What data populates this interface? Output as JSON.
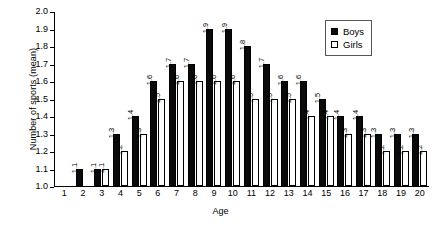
{
  "chart_data": {
    "type": "bar",
    "title": "",
    "xlabel": "Age",
    "ylabel": "Number of sports (mean)",
    "ylim": [
      1.0,
      2.0
    ],
    "yticks": [
      "1.0",
      "1.1",
      "1.2",
      "1.3",
      "1.4",
      "1.5",
      "1.6",
      "1.7",
      "1.8",
      "1.9",
      "2.0"
    ],
    "grid": false,
    "legend_position": "top-right",
    "categories": [
      "1",
      "2",
      "3",
      "4",
      "5",
      "6",
      "7",
      "8",
      "9",
      "10",
      "11",
      "12",
      "13",
      "14",
      "15",
      "16",
      "17",
      "18",
      "19",
      "20"
    ],
    "series": [
      {
        "name": "Boys",
        "color": "#0a0a0a",
        "values": [
          null,
          1.1,
          1.1,
          1.3,
          1.4,
          1.6,
          1.7,
          1.7,
          1.9,
          1.9,
          1.8,
          1.7,
          1.6,
          1.6,
          1.5,
          1.4,
          1.4,
          1.3,
          1.3,
          1.3
        ],
        "labels": [
          "",
          "1.1",
          "1.1",
          "1.3",
          "1.4",
          "1.6",
          "1.7",
          "1.7",
          "1.9",
          "1.9",
          "1.8",
          "1.7",
          "1.6",
          "1.6",
          "1.5",
          "1.4",
          "1.4",
          "1.3",
          "1.3",
          "1.3"
        ]
      },
      {
        "name": "Girls",
        "color": "#ffffff",
        "values": [
          null,
          null,
          1.1,
          1.2,
          1.3,
          1.5,
          1.6,
          1.6,
          1.6,
          1.6,
          1.5,
          1.5,
          1.5,
          1.4,
          1.4,
          1.3,
          1.3,
          1.2,
          1.2,
          1.2
        ],
        "labels": [
          "",
          "",
          "1.1",
          "1.2",
          "1.3",
          "1.5",
          "1.6",
          "1.6",
          "1.6",
          "1.6",
          "1.5",
          "1.5",
          "1.5",
          "1.4",
          "1.4",
          "1.3",
          "1.3",
          "1.2",
          "1.2",
          "1.2"
        ]
      }
    ]
  },
  "legend": {
    "items": [
      {
        "label": "Boys",
        "style": "filled"
      },
      {
        "label": "Girls",
        "style": "hollow"
      }
    ]
  }
}
